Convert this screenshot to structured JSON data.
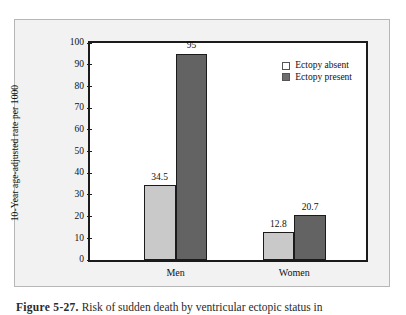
{
  "chart_data": {
    "type": "bar",
    "title": "",
    "xlabel": "",
    "ylabel": "10-Year age-adjusted rate per 1000",
    "categories": [
      "Men",
      "Women"
    ],
    "series": [
      {
        "name": "Ectopy absent",
        "values": [
          34.5,
          12.8
        ],
        "color": "#c9c9c9"
      },
      {
        "name": "Ectopy present",
        "values": [
          95,
          20.7
        ],
        "color": "#636363"
      }
    ],
    "value_labels": [
      [
        "34.5",
        "95"
      ],
      [
        "12.8",
        "20.7"
      ]
    ],
    "ylim": [
      0,
      100
    ],
    "yticks": [
      0,
      10,
      20,
      30,
      40,
      50,
      60,
      70,
      80,
      90,
      100
    ],
    "ytick_labels": [
      "0",
      "10",
      "20",
      "30",
      "40",
      "50",
      "60",
      "70",
      "80",
      "90",
      "100"
    ],
    "grid": false,
    "legend_position": "top-right"
  },
  "axis": {
    "y_title": "10-Year age-adjusted rate per 1000"
  },
  "legend": {
    "items": [
      {
        "label": "Ectopy absent"
      },
      {
        "label": "Ectopy present"
      }
    ]
  },
  "caption": {
    "figure_number": "Figure 5-27.",
    "text": "Risk of sudden death by ventricular ectopic status in"
  }
}
